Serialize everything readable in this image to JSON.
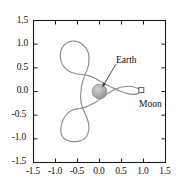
{
  "chart_data": {
    "type": "line",
    "title": "",
    "xlabel": "",
    "ylabel": "",
    "xlim": [
      -1.5,
      1.5
    ],
    "ylim": [
      -1.5,
      1.5
    ],
    "grid": false,
    "legend": null,
    "xticks": [
      "-1.5",
      "-1.0",
      "-0.5",
      "0.0",
      "0.5",
      "1.0",
      "1.5"
    ],
    "xtick_values": [
      -1.5,
      -1.0,
      -0.5,
      0.0,
      0.5,
      1.0,
      1.5
    ],
    "yticks": [
      "1.5",
      "1.0",
      "0.5",
      "0.0",
      "-0.5",
      "-1.0",
      "-1.5"
    ],
    "ytick_values": [
      1.5,
      1.0,
      0.5,
      0.0,
      -0.5,
      -1.0,
      -1.5
    ],
    "series": [
      {
        "name": "spacecraft-trajectory",
        "color": "#8c8c8c",
        "closed": true,
        "points": [
          [
            0.93,
            0.03
          ],
          [
            0.8,
            0.09
          ],
          [
            0.68,
            0.11
          ],
          [
            0.55,
            0.1
          ],
          [
            0.42,
            0.07
          ],
          [
            0.3,
            0.02
          ],
          [
            0.18,
            -0.05
          ],
          [
            0.05,
            -0.14
          ],
          [
            -0.08,
            -0.22
          ],
          [
            -0.2,
            -0.28
          ],
          [
            -0.32,
            -0.33
          ],
          [
            -0.45,
            -0.36
          ],
          [
            -0.58,
            -0.38
          ],
          [
            -0.7,
            -0.44
          ],
          [
            -0.8,
            -0.55
          ],
          [
            -0.86,
            -0.69
          ],
          [
            -0.88,
            -0.83
          ],
          [
            -0.85,
            -0.94
          ],
          [
            -0.78,
            -1.01
          ],
          [
            -0.67,
            -1.05
          ],
          [
            -0.55,
            -1.06
          ],
          [
            -0.43,
            -1.04
          ],
          [
            -0.33,
            -0.99
          ],
          [
            -0.27,
            -0.9
          ],
          [
            -0.24,
            -0.79
          ],
          [
            -0.25,
            -0.67
          ],
          [
            -0.29,
            -0.55
          ],
          [
            -0.34,
            -0.44
          ],
          [
            -0.39,
            -0.33
          ],
          [
            -0.42,
            -0.22
          ],
          [
            -0.43,
            -0.11
          ],
          [
            -0.42,
            0.0
          ],
          [
            -0.41,
            0.11
          ],
          [
            -0.38,
            0.22
          ],
          [
            -0.34,
            0.33
          ],
          [
            -0.29,
            0.44
          ],
          [
            -0.25,
            0.56
          ],
          [
            -0.24,
            0.68
          ],
          [
            -0.25,
            0.8
          ],
          [
            -0.31,
            0.92
          ],
          [
            -0.41,
            1.01
          ],
          [
            -0.53,
            1.06
          ],
          [
            -0.66,
            1.06
          ],
          [
            -0.77,
            1.01
          ],
          [
            -0.85,
            0.92
          ],
          [
            -0.89,
            0.8
          ],
          [
            -0.88,
            0.67
          ],
          [
            -0.83,
            0.55
          ],
          [
            -0.74,
            0.46
          ],
          [
            -0.63,
            0.4
          ],
          [
            -0.51,
            0.37
          ],
          [
            -0.39,
            0.36
          ],
          [
            -0.27,
            0.34
          ],
          [
            -0.15,
            0.3
          ],
          [
            -0.03,
            0.24
          ],
          [
            0.1,
            0.17
          ],
          [
            0.23,
            0.11
          ],
          [
            0.36,
            0.05
          ],
          [
            0.49,
            0.0
          ],
          [
            0.62,
            -0.04
          ],
          [
            0.75,
            -0.06
          ],
          [
            0.86,
            -0.05
          ],
          [
            0.93,
            0.0
          ]
        ]
      }
    ],
    "markers": [
      {
        "name": "earth",
        "label": "Earth",
        "x": 0.0,
        "y": 0.0,
        "shape": "filled-circle",
        "color": "#a8a8a8",
        "radius_px": 7.5
      },
      {
        "name": "moon",
        "label": "Moon",
        "x": 0.95,
        "y": 0.03,
        "shape": "open-square",
        "color": "#ffffff",
        "edge_color": "#5a5a5a",
        "size_px": 5
      }
    ],
    "annotations": [
      {
        "name": "earth-annotation",
        "text": "Earth",
        "text_x": 0.42,
        "text_y": 0.62,
        "arrow_to_x": 0.07,
        "arrow_to_y": 0.1,
        "has_arrow": true
      },
      {
        "name": "moon-annotation",
        "text": "Moon",
        "text_x": 0.85,
        "text_y": -0.25,
        "has_arrow": false
      }
    ]
  },
  "axes": {
    "frame_color": "#1a1a1a",
    "tick_direction": "in",
    "x_tick_labels": [
      "-1.5",
      "-1.0",
      "-0.5",
      "0.0",
      "0.5",
      "1.0",
      "1.5"
    ],
    "y_tick_labels": [
      "1.5",
      "1.0",
      "0.5",
      "0.0",
      "-0.5",
      "-1.0",
      "-1.5"
    ]
  },
  "labels": {
    "earth": "Earth",
    "moon": "Moon"
  }
}
